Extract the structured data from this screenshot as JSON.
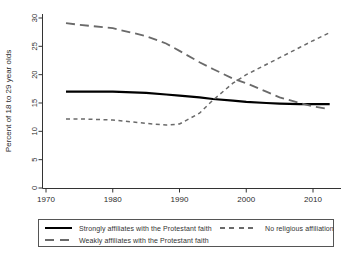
{
  "figure": {
    "background": "#ffffff",
    "axis_color": "#333333",
    "text_color": "#2b2b2b"
  },
  "chart_data": {
    "type": "line",
    "title": "",
    "xlabel": "",
    "ylabel": "Percent of 18 to 29 year olds",
    "xlim": [
      1969.4,
      2014.2
    ],
    "ylim": [
      0,
      30
    ],
    "x_ticks": [
      1970,
      1980,
      1990,
      2000,
      2010
    ],
    "y_ticks": [
      0,
      5,
      10,
      15,
      20,
      25,
      30
    ],
    "grid": false,
    "legend_position": "bottom-box",
    "x": [
      1973,
      1975,
      1980,
      1985,
      1988,
      1990,
      1993,
      1995,
      1998,
      2000,
      2003,
      2005,
      2008,
      2010,
      2012.5
    ],
    "series": [
      {
        "name": "Strongly affiliates with the Protestant faith",
        "style": "solid",
        "color": "#000000",
        "width": 2.2,
        "values": [
          17.0,
          17.0,
          17.0,
          16.8,
          16.5,
          16.3,
          16.0,
          15.7,
          15.4,
          15.2,
          15.0,
          14.9,
          14.8,
          14.8,
          14.8
        ]
      },
      {
        "name": "Weakly affiliates with the Protestant faith",
        "style": "long-dash",
        "color": "#6a6a6a",
        "width": 1.8,
        "values": [
          29.1,
          28.8,
          28.2,
          26.8,
          25.5,
          24.2,
          22.2,
          21.0,
          19.3,
          18.5,
          17.0,
          16.0,
          15.0,
          14.4,
          13.9
        ]
      },
      {
        "name": "No religious affiliation",
        "style": "short-dash",
        "color": "#6a6a6a",
        "width": 1.5,
        "values": [
          12.2,
          12.2,
          12.0,
          11.4,
          11.1,
          11.3,
          13.2,
          15.5,
          18.5,
          20.0,
          21.8,
          23.0,
          24.8,
          26.0,
          27.4
        ]
      }
    ]
  }
}
